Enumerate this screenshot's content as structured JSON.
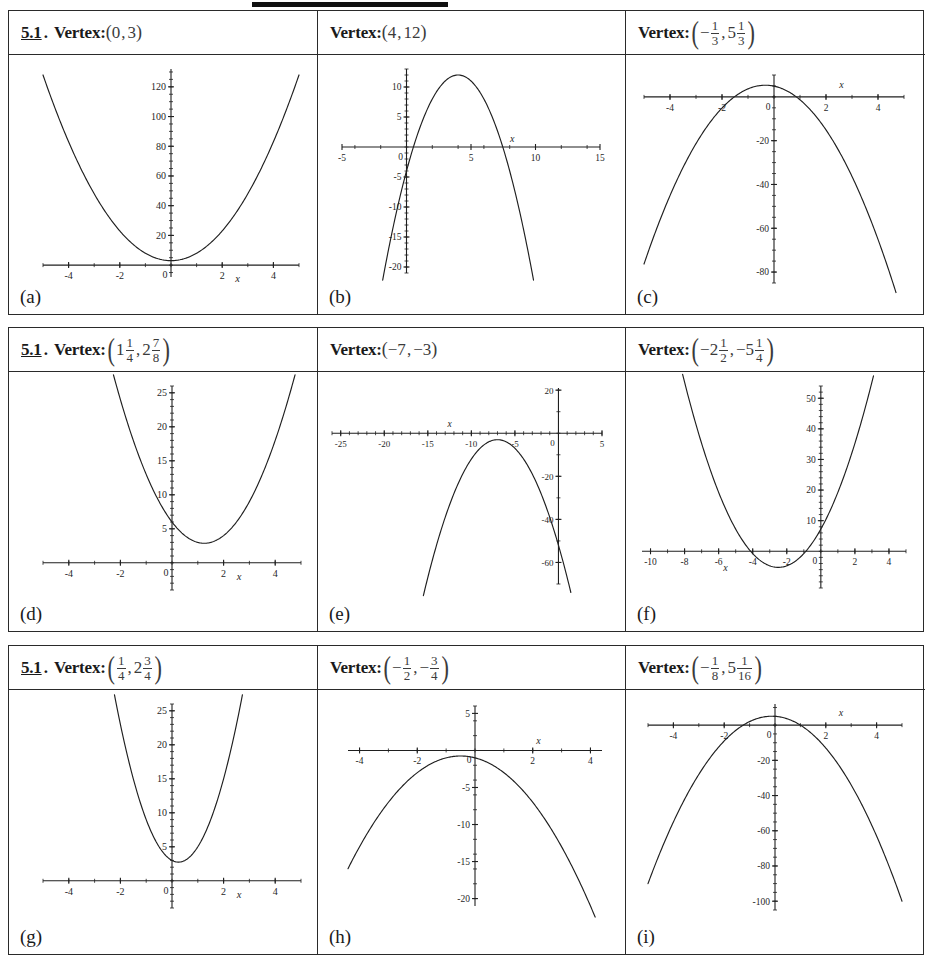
{
  "worksheet": {
    "section_number": "5.1",
    "section_dot": ".",
    "vertex_label": "Vertex:"
  },
  "panels": [
    {
      "id": "a",
      "label": "(a)",
      "show_section": true,
      "vertex_text": "(0,3)",
      "vertex_parts": [
        {
          "t": "paren",
          "v": "("
        },
        {
          "t": "int",
          "v": "0"
        },
        {
          "t": "comma",
          "v": ","
        },
        {
          "t": "int",
          "v": "3"
        },
        {
          "t": "paren",
          "v": ")"
        }
      ]
    },
    {
      "id": "b",
      "label": "(b)",
      "show_section": false,
      "vertex_text": "(4,12)",
      "vertex_parts": [
        {
          "t": "paren",
          "v": "("
        },
        {
          "t": "int",
          "v": "4"
        },
        {
          "t": "comma",
          "v": ","
        },
        {
          "t": "int",
          "v": "12"
        },
        {
          "t": "paren",
          "v": ")"
        }
      ]
    },
    {
      "id": "c",
      "label": "(c)",
      "show_section": false,
      "vertex_text": "(-1/3, 5 1/3)",
      "vertex_parts": [
        {
          "t": "bigparen",
          "v": "("
        },
        {
          "t": "sign",
          "v": "−"
        },
        {
          "t": "frac",
          "num": "1",
          "den": "3"
        },
        {
          "t": "comma",
          "v": ","
        },
        {
          "t": "int",
          "v": "5"
        },
        {
          "t": "frac",
          "num": "1",
          "den": "3"
        },
        {
          "t": "bigparen",
          "v": ")"
        }
      ]
    },
    {
      "id": "d",
      "label": "(d)",
      "show_section": true,
      "vertex_text": "(1 1/4, 2 7/8)",
      "vertex_parts": [
        {
          "t": "bigparen",
          "v": "("
        },
        {
          "t": "int",
          "v": "1"
        },
        {
          "t": "frac",
          "num": "1",
          "den": "4"
        },
        {
          "t": "comma",
          "v": ","
        },
        {
          "t": "int",
          "v": "2"
        },
        {
          "t": "frac",
          "num": "7",
          "den": "8"
        },
        {
          "t": "bigparen",
          "v": ")"
        }
      ]
    },
    {
      "id": "e",
      "label": "(e)",
      "show_section": false,
      "vertex_text": "(-7,-3)",
      "vertex_parts": [
        {
          "t": "paren",
          "v": "("
        },
        {
          "t": "int",
          "v": "−7"
        },
        {
          "t": "comma",
          "v": ","
        },
        {
          "t": "int",
          "v": "−3"
        },
        {
          "t": "paren",
          "v": ")"
        }
      ]
    },
    {
      "id": "f",
      "label": "(f)",
      "show_section": false,
      "vertex_text": "(-2 1/2, -5 1/4)",
      "vertex_parts": [
        {
          "t": "bigparen",
          "v": "("
        },
        {
          "t": "int",
          "v": "−2"
        },
        {
          "t": "frac",
          "num": "1",
          "den": "2"
        },
        {
          "t": "comma",
          "v": ","
        },
        {
          "t": "int",
          "v": "−5"
        },
        {
          "t": "frac",
          "num": "1",
          "den": "4"
        },
        {
          "t": "bigparen",
          "v": ")"
        }
      ]
    },
    {
      "id": "g",
      "label": "(g)",
      "show_section": true,
      "vertex_text": "(1/4, 2 3/4)",
      "vertex_parts": [
        {
          "t": "bigparen",
          "v": "("
        },
        {
          "t": "frac",
          "num": "1",
          "den": "4"
        },
        {
          "t": "comma",
          "v": ","
        },
        {
          "t": "int",
          "v": "2"
        },
        {
          "t": "frac",
          "num": "3",
          "den": "4"
        },
        {
          "t": "bigparen",
          "v": ")"
        }
      ]
    },
    {
      "id": "h",
      "label": "(h)",
      "show_section": false,
      "vertex_text": "(-1/2, -3/4)",
      "vertex_parts": [
        {
          "t": "bigparen",
          "v": "("
        },
        {
          "t": "sign",
          "v": "−"
        },
        {
          "t": "frac",
          "num": "1",
          "den": "2"
        },
        {
          "t": "comma",
          "v": ","
        },
        {
          "t": "sign",
          "v": "−"
        },
        {
          "t": "frac",
          "num": "3",
          "den": "4"
        },
        {
          "t": "bigparen",
          "v": ")"
        }
      ]
    },
    {
      "id": "i",
      "label": "(i)",
      "show_section": false,
      "vertex_text": "(-1/8, 5 1/16)",
      "vertex_parts": [
        {
          "t": "bigparen",
          "v": "("
        },
        {
          "t": "sign",
          "v": "−"
        },
        {
          "t": "frac",
          "num": "1",
          "den": "8"
        },
        {
          "t": "comma",
          "v": ","
        },
        {
          "t": "int",
          "v": "5"
        },
        {
          "t": "frac",
          "num": "1",
          "den": "16"
        },
        {
          "t": "bigparen",
          "v": ")"
        }
      ]
    }
  ],
  "chart_data": [
    {
      "type": "line",
      "panel": "a",
      "title": "",
      "xlabel": "x",
      "ylabel": "",
      "xlim": [
        -5,
        5
      ],
      "ylim": [
        -8,
        132
      ],
      "xticks": [
        -4,
        -2,
        0,
        2,
        4
      ],
      "yticks": [
        20,
        40,
        60,
        80,
        100,
        120
      ],
      "xtick_labels": [
        "-4",
        "-2",
        "0",
        "2",
        "4"
      ],
      "ytick_labels": [
        "20",
        "40",
        "60",
        "80",
        "100",
        "120"
      ],
      "grid": false,
      "legend": "none",
      "curve": {
        "kind": "parabola",
        "a": 5,
        "h": 0,
        "k": 3,
        "opens": "up"
      },
      "vertex": [
        0,
        3
      ]
    },
    {
      "type": "line",
      "panel": "b",
      "title": "",
      "xlabel": "x",
      "ylabel": "",
      "xlim": [
        -5,
        15
      ],
      "ylim": [
        -21,
        13
      ],
      "xticks": [
        -5,
        5,
        10,
        15
      ],
      "yticks": [
        10,
        5,
        -5,
        -10,
        -15,
        -20
      ],
      "xtick_labels": [
        "-5",
        "5",
        "10",
        "15"
      ],
      "ytick_labels": [
        "10",
        "5",
        "0",
        "-5",
        "-10",
        "-15",
        "-20"
      ],
      "grid": false,
      "legend": "none",
      "curve": {
        "kind": "parabola",
        "a": -1,
        "h": 4,
        "k": 12,
        "opens": "down"
      },
      "vertex": [
        4,
        12
      ]
    },
    {
      "type": "line",
      "panel": "c",
      "title": "",
      "xlabel": "x",
      "ylabel": "",
      "xlim": [
        -5,
        5
      ],
      "ylim": [
        -85,
        10
      ],
      "xticks": [
        -4,
        -2,
        0,
        2,
        4
      ],
      "yticks": [
        -20,
        -40,
        -60,
        -80
      ],
      "xtick_labels": [
        "-4",
        "-2",
        "0",
        "2",
        "4"
      ],
      "ytick_labels": [
        "0",
        "-20",
        "-40",
        "-60",
        "-80"
      ],
      "grid": false,
      "legend": "none",
      "curve": {
        "kind": "parabola",
        "a": -3.75,
        "h": -0.333,
        "k": 5.333,
        "opens": "down"
      },
      "vertex": [
        -0.333,
        5.333
      ]
    },
    {
      "type": "line",
      "panel": "d",
      "title": "",
      "xlabel": "x",
      "ylabel": "",
      "xlim": [
        -5,
        5
      ],
      "ylim": [
        -4,
        26
      ],
      "xticks": [
        -4,
        -2,
        0,
        2,
        4
      ],
      "yticks": [
        5,
        10,
        15,
        20,
        25
      ],
      "xtick_labels": [
        "-4",
        "-2",
        "0",
        "2",
        "4"
      ],
      "ytick_labels": [
        "5",
        "10",
        "15",
        "20",
        "25"
      ],
      "grid": false,
      "legend": "none",
      "curve": {
        "kind": "parabola",
        "a": 2,
        "h": 1.25,
        "k": 2.875,
        "opens": "up"
      },
      "vertex": [
        1.25,
        2.875
      ]
    },
    {
      "type": "line",
      "panel": "e",
      "title": "",
      "xlabel": "x",
      "ylabel": "",
      "xlim": [
        -26,
        5
      ],
      "ylim": [
        -70,
        21
      ],
      "xticks": [
        -25,
        -20,
        -15,
        -10,
        -5,
        5
      ],
      "yticks": [
        20,
        -20,
        -40,
        -60
      ],
      "xtick_labels": [
        "-25",
        "-20",
        "-15",
        "-10",
        "-5",
        "5"
      ],
      "ytick_labels": [
        "20",
        "0",
        "-20",
        "-40",
        "-60"
      ],
      "grid": false,
      "legend": "none",
      "curve": {
        "kind": "parabola",
        "a": -1,
        "h": -7,
        "k": -3,
        "opens": "down"
      },
      "vertex": [
        -7,
        -3
      ]
    },
    {
      "type": "line",
      "panel": "f",
      "title": "",
      "xlabel": "x",
      "ylabel": "",
      "xlim": [
        -10.5,
        5
      ],
      "ylim": [
        -12,
        54
      ],
      "xticks": [
        -10,
        -8,
        -6,
        -4,
        -2,
        0,
        2,
        4
      ],
      "yticks": [
        10,
        20,
        30,
        40,
        50
      ],
      "xtick_labels": [
        "-10",
        "-8",
        "-6",
        "-4",
        "-2",
        "0",
        "2",
        "4"
      ],
      "ytick_labels": [
        "10",
        "20",
        "30",
        "40",
        "50"
      ],
      "grid": false,
      "legend": "none",
      "curve": {
        "kind": "parabola",
        "a": 2,
        "h": -2.5,
        "k": -5.25,
        "opens": "up"
      },
      "vertex": [
        -2.5,
        -5.25
      ]
    },
    {
      "type": "line",
      "panel": "g",
      "title": "",
      "xlabel": "x",
      "ylabel": "",
      "xlim": [
        -5,
        5
      ],
      "ylim": [
        -4,
        26
      ],
      "xticks": [
        -4,
        -2,
        0,
        2,
        4
      ],
      "yticks": [
        5,
        10,
        15,
        20,
        25
      ],
      "xtick_labels": [
        "-4",
        "-2",
        "0",
        "2",
        "4"
      ],
      "ytick_labels": [
        "5",
        "10",
        "15",
        "20",
        "25"
      ],
      "grid": false,
      "legend": "none",
      "curve": {
        "kind": "parabola",
        "a": 4,
        "h": 0.25,
        "k": 2.75,
        "opens": "up"
      },
      "vertex": [
        0.25,
        2.75
      ]
    },
    {
      "type": "line",
      "panel": "h",
      "title": "",
      "xlabel": "x",
      "ylabel": "",
      "xlim": [
        -4.4,
        4.4
      ],
      "ylim": [
        -21,
        6
      ],
      "xticks": [
        -4,
        -2,
        2,
        4
      ],
      "yticks": [
        5,
        -5,
        -10,
        -15,
        -20
      ],
      "xtick_labels": [
        "-4",
        "-2",
        "2",
        "4"
      ],
      "ytick_labels": [
        "5",
        "0",
        "-5",
        "-10",
        "-15",
        "-20"
      ],
      "grid": false,
      "legend": "none",
      "curve": {
        "kind": "parabola",
        "a": -1,
        "h": -0.5,
        "k": -0.75,
        "opens": "down"
      },
      "vertex": [
        -0.5,
        -0.75
      ]
    },
    {
      "type": "line",
      "panel": "i",
      "title": "",
      "xlabel": "x",
      "ylabel": "",
      "xlim": [
        -5,
        5
      ],
      "ylim": [
        -105,
        12
      ],
      "xticks": [
        -4,
        -2,
        0,
        2,
        4
      ],
      "yticks": [
        -20,
        -40,
        -60,
        -80,
        -100
      ],
      "xtick_labels": [
        "-4",
        "-2",
        "0",
        "2",
        "4"
      ],
      "ytick_labels": [
        "0",
        "-20",
        "-40",
        "-60",
        "-80",
        "-100"
      ],
      "grid": false,
      "legend": "none",
      "curve": {
        "kind": "parabola",
        "a": -4,
        "h": -0.125,
        "k": 5.0625,
        "opens": "down"
      },
      "vertex": [
        -0.125,
        5.0625
      ]
    }
  ]
}
